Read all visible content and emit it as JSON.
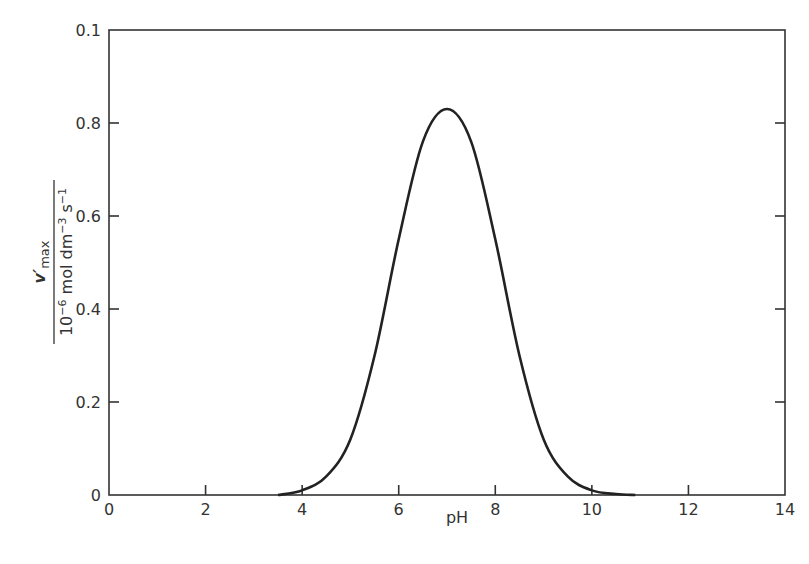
{
  "chart_data": {
    "type": "line",
    "title": "",
    "xlabel": "pH",
    "ylabel": {
      "numerator": "v′max",
      "denominator": "10⁻⁶ mol dm⁻³ s⁻¹"
    },
    "xlim": [
      0,
      14
    ],
    "ylim": [
      0,
      1.0
    ],
    "x_ticks": [
      0,
      2,
      4,
      6,
      8,
      10,
      12,
      14
    ],
    "x_tick_labels": [
      "0",
      "2",
      "4",
      "6",
      "8",
      "10",
      "12",
      "14"
    ],
    "y_ticks": [
      0,
      0.2,
      0.4,
      0.6,
      0.8,
      1.0
    ],
    "y_tick_labels": [
      "0",
      "0.2",
      "0.4",
      "0.6",
      "0.8",
      "0.1"
    ],
    "grid": false,
    "legend": null,
    "series": [
      {
        "name": "v′max",
        "x": [
          3.5,
          4.0,
          4.5,
          5.0,
          5.5,
          6.0,
          6.5,
          7.0,
          7.5,
          8.0,
          8.5,
          9.0,
          9.5,
          10.0,
          10.5,
          10.9
        ],
        "values": [
          0.0,
          0.01,
          0.04,
          0.12,
          0.3,
          0.55,
          0.76,
          0.83,
          0.76,
          0.55,
          0.3,
          0.12,
          0.04,
          0.01,
          0.002,
          0.0
        ]
      }
    ]
  }
}
